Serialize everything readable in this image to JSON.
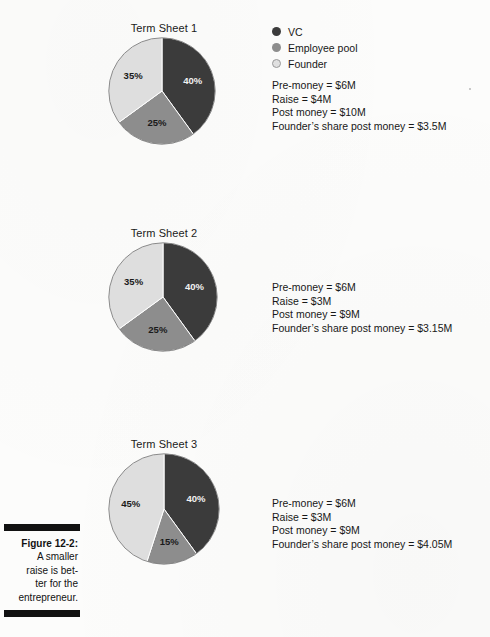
{
  "figure": {
    "caption_label": "Figure 12-2:",
    "caption_lines": [
      "A smaller",
      "raise is bet-",
      "ter for the",
      "entrepreneur."
    ]
  },
  "legend": {
    "items": [
      {
        "label": "VC",
        "color": "#3b3b3b",
        "icon": "legend-dot-icon"
      },
      {
        "label": "Employee pool",
        "color": "#8d8d8d",
        "icon": "legend-dot-icon"
      },
      {
        "label": "Founder",
        "color": "#e0e0e0",
        "icon": "legend-dot-icon"
      }
    ]
  },
  "charts": [
    {
      "title": "Term Sheet 1",
      "stats": [
        "Pre-money = $6M",
        "Raise = $4M",
        "Post money = $10M",
        "Founder’s share post money = $3.5M"
      ],
      "labels": [
        "40%",
        "25%",
        "35%"
      ]
    },
    {
      "title": "Term Sheet 2",
      "stats": [
        "Pre-money = $6M",
        "Raise = $3M",
        "Post money = $9M",
        "Founder’s share post money = $3.15M"
      ],
      "labels": [
        "40%",
        "25%",
        "35%"
      ]
    },
    {
      "title": "Term Sheet 3",
      "stats": [
        "Pre-money = $6M",
        "Raise = $3M",
        "Post money = $9M",
        "Founder’s share post money = $4.05M"
      ],
      "labels": [
        "40%",
        "15%",
        "45%"
      ]
    }
  ],
  "chart_data": [
    {
      "type": "pie",
      "title": "Term Sheet 1",
      "categories": [
        "VC",
        "Employee pool",
        "Founder"
      ],
      "values": [
        40,
        25,
        35
      ],
      "data_labels": [
        "40%",
        "25%",
        "35%"
      ],
      "colors": [
        "#3b3b3b",
        "#8d8d8d",
        "#dedede"
      ],
      "start_angle": 0,
      "direction": "clockwise",
      "legend_position": "right",
      "grid": false,
      "annotations": [
        "Pre-money = $6M",
        "Raise = $4M",
        "Post money = $10M",
        "Founder’s share post money = $3.5M"
      ]
    },
    {
      "type": "pie",
      "title": "Term Sheet 2",
      "categories": [
        "VC",
        "Employee pool",
        "Founder"
      ],
      "values": [
        40,
        25,
        35
      ],
      "data_labels": [
        "40%",
        "25%",
        "35%"
      ],
      "colors": [
        "#3b3b3b",
        "#8d8d8d",
        "#dedede"
      ],
      "start_angle": 0,
      "direction": "clockwise",
      "legend_position": "right",
      "grid": false,
      "annotations": [
        "Pre-money = $6M",
        "Raise = $3M",
        "Post money = $9M",
        "Founder’s share post money = $3.15M"
      ]
    },
    {
      "type": "pie",
      "title": "Term Sheet 3",
      "categories": [
        "VC",
        "Employee pool",
        "Founder"
      ],
      "values": [
        40,
        15,
        45
      ],
      "data_labels": [
        "40%",
        "15%",
        "45%"
      ],
      "colors": [
        "#3b3b3b",
        "#8d8d8d",
        "#dedede"
      ],
      "start_angle": 0,
      "direction": "clockwise",
      "legend_position": "right",
      "grid": false,
      "annotations": [
        "Pre-money = $6M",
        "Raise = $3M",
        "Post money = $9M",
        "Founder’s share post money = $4.05M"
      ]
    }
  ]
}
